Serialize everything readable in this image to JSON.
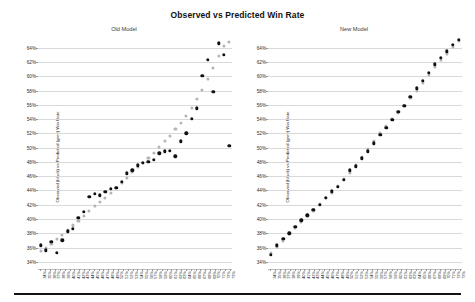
{
  "figure": {
    "title": "Observed vs Predicted Win Rate",
    "y_axis_label": "Observed (black) vs Predicted (grey) Win Rate",
    "colors": {
      "observed": "#111111",
      "predicted": "#b4b4b4",
      "grid": "#d9d9d9",
      "background": "#ffffff",
      "rule": "#121212"
    }
  },
  "panels": [
    {
      "id": "old-model",
      "title": "Old Model"
    },
    {
      "id": "new-model",
      "title": "New Model"
    }
  ],
  "chart_data": [
    {
      "type": "scatter",
      "title": "Old Model",
      "subplot_index": 0,
      "xlabel": "",
      "ylabel": "Observed (black) vs Predicted (grey) Win Rate",
      "ylim": [
        33,
        65.5
      ],
      "yticks": [
        34,
        36,
        38,
        40,
        42,
        44,
        46,
        48,
        50,
        52,
        54,
        56,
        58,
        60,
        62,
        64
      ],
      "ytick_labels": [
        "34%",
        "36%",
        "38%",
        "40%",
        "42%",
        "44%",
        "46%",
        "48%",
        "50%",
        "52%",
        "54%",
        "56%",
        "58%",
        "60%",
        "62%",
        "64%"
      ],
      "grid": true,
      "legend": "encoded in y-axis label",
      "categories": [
        "34%",
        "35%",
        "36%",
        "37%",
        "38%",
        "39%",
        "40%",
        "41%",
        "42%",
        "43%",
        "44%",
        "45%",
        "46%",
        "47%",
        "48%",
        "49%",
        "50%",
        "51%",
        "52%",
        "53%",
        "54%",
        "55%",
        "56%",
        "57%",
        "58%",
        "59%",
        "60%",
        "61%",
        "62%",
        "63%",
        "64%",
        "65%",
        "66%",
        "67%",
        "68%",
        "69%",
        "70%",
        "71%",
        "72%",
        "73%"
      ],
      "xtick_labels": [
        "34%",
        "35%",
        "36%",
        "37%",
        "38%",
        "39%",
        "40%",
        "41%",
        "42%",
        "43%",
        "44%",
        "45%",
        "46%",
        "47%",
        "48%",
        "49%",
        "50%",
        "51%",
        "52%",
        "53%",
        "54%",
        "55%",
        "56%",
        "57%",
        "58%",
        "59%",
        "60%",
        "61%",
        "62%",
        "63%",
        "64%",
        "65%",
        "66%",
        "67%",
        "68%",
        "69%",
        "70%",
        "71%",
        "72%",
        "73%"
      ],
      "series": [
        {
          "name": "Observed",
          "color": "#111111",
          "values": [
            36.3,
            35.6,
            36.8,
            35.3,
            37.0,
            38.3,
            38.6,
            40.2,
            41.0,
            43.1,
            43.5,
            43.3,
            43.8,
            44.2,
            44.4,
            45.2,
            46.4,
            46.8,
            47.5,
            47.9,
            48.0,
            48.3,
            49.2,
            49.5,
            49.6,
            48.8,
            50.9,
            52.0,
            54.0,
            55.5,
            60.1,
            62.3,
            57.8,
            64.6,
            63.0,
            50.3
          ]
        },
        {
          "name": "Predicted",
          "color": "#b4b4b4",
          "values": [
            35.5,
            36.0,
            36.5,
            37.2,
            37.8,
            38.4,
            39.1,
            39.7,
            40.4,
            41.1,
            41.8,
            42.4,
            43.0,
            43.6,
            44.3,
            45.0,
            45.8,
            46.6,
            47.3,
            47.9,
            48.6,
            49.3,
            50.1,
            50.9,
            51.7,
            52.6,
            53.5,
            54.5,
            55.6,
            56.8,
            58.1,
            59.6,
            61.2,
            62.8,
            64.2,
            64.8
          ]
        }
      ]
    },
    {
      "type": "scatter",
      "title": "New Model",
      "subplot_index": 1,
      "xlabel": "",
      "ylabel": "Observed (black) vs Predicted (grey) Win Rate",
      "ylim": [
        33,
        65.5
      ],
      "yticks": [
        34,
        36,
        38,
        40,
        42,
        44,
        46,
        48,
        50,
        52,
        54,
        56,
        58,
        60,
        62,
        64
      ],
      "ytick_labels": [
        "34%",
        "36%",
        "38%",
        "40%",
        "42%",
        "44%",
        "46%",
        "48%",
        "50%",
        "52%",
        "54%",
        "56%",
        "58%",
        "60%",
        "62%",
        "64%"
      ],
      "grid": true,
      "legend": "encoded in y-axis label",
      "categories": [
        "34%",
        "35%",
        "36%",
        "37%",
        "38%",
        "39%",
        "40%",
        "41%",
        "42%",
        "43%",
        "44%",
        "45%",
        "46%",
        "47%",
        "48%",
        "49%",
        "50%",
        "51%",
        "52%",
        "53%",
        "54%",
        "55%",
        "56%",
        "57%",
        "58%",
        "59%",
        "60%",
        "61%",
        "62%",
        "63%",
        "64%",
        "65%",
        "66%",
        "67%",
        "68%",
        "69%",
        "70%",
        "71%",
        "72%",
        "73%"
      ],
      "xtick_labels": [
        "34%",
        "35%",
        "36%",
        "37%",
        "38%",
        "39%",
        "40%",
        "41%",
        "42%",
        "43%",
        "44%",
        "45%",
        "46%",
        "47%",
        "48%",
        "49%",
        "50%",
        "51%",
        "52%",
        "53%",
        "54%",
        "55%",
        "56%",
        "57%",
        "58%",
        "59%",
        "60%",
        "61%",
        "62%",
        "63%",
        "64%",
        "65%",
        "66%",
        "67%",
        "68%",
        "69%",
        "70%",
        "71%",
        "72%",
        "73%"
      ],
      "series": [
        {
          "name": "Observed",
          "color": "#111111",
          "values": [
            35.0,
            36.3,
            37.2,
            38.0,
            38.9,
            39.8,
            40.5,
            41.3,
            42.0,
            43.0,
            43.9,
            44.5,
            45.5,
            46.8,
            47.4,
            48.5,
            49.5,
            50.6,
            51.8,
            52.8,
            53.9,
            55.0,
            55.9,
            57.1,
            58.3,
            59.4,
            60.5,
            61.7,
            62.6,
            63.5,
            64.4,
            65.1
          ]
        },
        {
          "name": "Predicted",
          "color": "#b4b4b4",
          "values": [
            35.2,
            36.1,
            37.0,
            37.9,
            38.7,
            39.6,
            40.4,
            41.2,
            42.1,
            42.9,
            43.7,
            44.6,
            45.6,
            46.5,
            47.6,
            48.7,
            49.8,
            50.9,
            52.0,
            53.0,
            54.0,
            54.9,
            55.8,
            56.9,
            58.0,
            59.1,
            60.2,
            61.3,
            62.3,
            63.2,
            64.1,
            64.9
          ]
        }
      ]
    }
  ]
}
